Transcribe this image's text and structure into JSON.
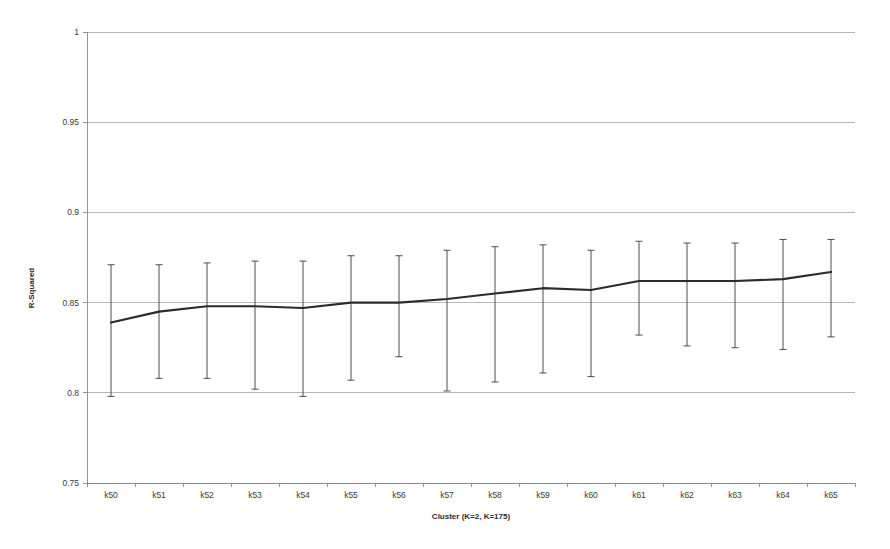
{
  "chart_data": {
    "type": "line",
    "title": "",
    "subtitle": "",
    "xlabel": "Cluster (K=2, K=175)",
    "ylabel": "R-Squared",
    "categories": [
      "k50",
      "k51",
      "k52",
      "k53",
      "k54",
      "k55",
      "k56",
      "k57",
      "k58",
      "k59",
      "k60",
      "k61",
      "k62",
      "k63",
      "k64",
      "k65"
    ],
    "values": [
      0.839,
      0.845,
      0.848,
      0.848,
      0.847,
      0.85,
      0.85,
      0.852,
      0.855,
      0.858,
      0.857,
      0.862,
      0.862,
      0.862,
      0.863,
      0.867
    ],
    "error_upper": [
      0.871,
      0.871,
      0.872,
      0.873,
      0.873,
      0.876,
      0.876,
      0.879,
      0.881,
      0.882,
      0.879,
      0.884,
      0.883,
      0.883,
      0.885,
      0.885
    ],
    "error_lower": [
      0.798,
      0.808,
      0.808,
      0.802,
      0.798,
      0.807,
      0.82,
      0.801,
      0.806,
      0.811,
      0.809,
      0.832,
      0.826,
      0.825,
      0.824,
      0.831
    ],
    "series": [
      {
        "name": "R-Squared mean",
        "values": [
          0.839,
          0.845,
          0.848,
          0.848,
          0.847,
          0.85,
          0.85,
          0.852,
          0.855,
          0.858,
          0.857,
          0.862,
          0.862,
          0.862,
          0.863,
          0.867
        ]
      }
    ],
    "ylim": [
      0.75,
      1.0
    ],
    "yticks": [
      0.75,
      0.8,
      0.85,
      0.9,
      0.95,
      1.0
    ],
    "ytick_labels": [
      "0.75",
      "0.8",
      "0.85",
      "0.9",
      "0.95",
      "1"
    ],
    "grid": true,
    "grid_axis": "y",
    "legend": false,
    "legend_position": "none",
    "error_bars": true,
    "colors": {
      "line": "#2b2b2b",
      "error_bar": "#555555",
      "gridline": "#9a9a9a",
      "axis": "#7d7d7d",
      "text": "#3a3a3a",
      "background": "#ffffff"
    }
  },
  "layout": {
    "plot_left": 87,
    "plot_right": 855,
    "plot_top": 32,
    "plot_bottom": 483,
    "width": 890,
    "height": 549
  }
}
